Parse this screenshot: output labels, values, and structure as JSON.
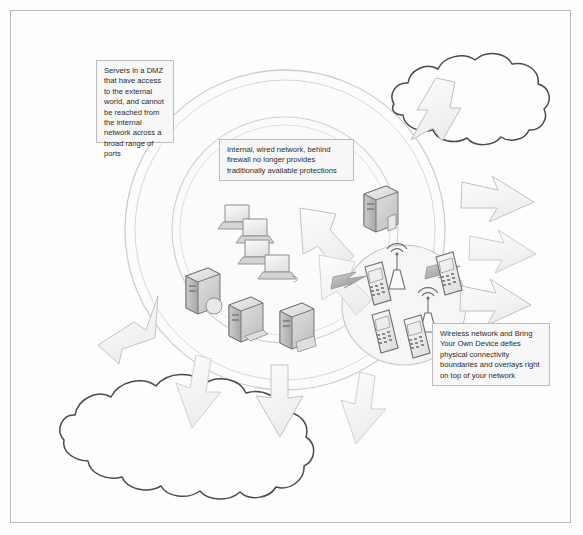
{
  "diagram": {
    "background_color": "#fdfdfd",
    "frame_border_color": "#b9b9b9",
    "callouts": [
      {
        "id": "dmz",
        "name": "callout-dmz",
        "text": "Servers in a DMZ that have access to the external world, and cannot be reached from the internal network across a broad range of ports"
      },
      {
        "id": "internal",
        "name": "callout-internal",
        "text": "Internal, wired network, behind firewall no longer provides traditionally available protections"
      },
      {
        "id": "wireless",
        "name": "callout-wireless",
        "text": "Wireless network and Bring Your Own Device defies physical connectivity boundaries and overlays right on top of your network"
      }
    ],
    "zones": [
      {
        "id": "outer-circle",
        "name": "dmz-zone-circle",
        "stroke": "#c9c9c9"
      },
      {
        "id": "inner-circle",
        "name": "internal-network-circle",
        "stroke": "#cfcfcf"
      },
      {
        "id": "wireless-circle",
        "name": "wireless-byod-circle",
        "stroke": "#c4c4c4"
      }
    ],
    "clouds": [
      {
        "id": "cloud-top-right",
        "name": "external-cloud-top-right",
        "stroke": "#4a4a4a"
      },
      {
        "id": "cloud-bottom-left",
        "name": "external-cloud-bottom-left",
        "stroke": "#4a4a4a"
      }
    ],
    "devices": {
      "laptops": {
        "count": 4,
        "name": "laptop-icon",
        "label": "Workstation laptops"
      },
      "servers": {
        "count": 4,
        "name": "server-icon",
        "label": "Server towers"
      },
      "access_points": {
        "count": 2,
        "name": "wireless-access-point-icon",
        "label": "Wireless access points"
      },
      "phones": {
        "count": 4,
        "name": "mobile-phone-icon",
        "label": "Mobile phones"
      }
    },
    "arrows": {
      "count": 9,
      "name": "traffic-flow-arrow",
      "fill": "#fbfbfb",
      "stroke": "#c2c2c2",
      "label": "Traffic crossing perimeter"
    },
    "connectors": {
      "count": 2,
      "name": "wireless-link-bolt",
      "label": "Wireless link lightning bolts"
    }
  }
}
